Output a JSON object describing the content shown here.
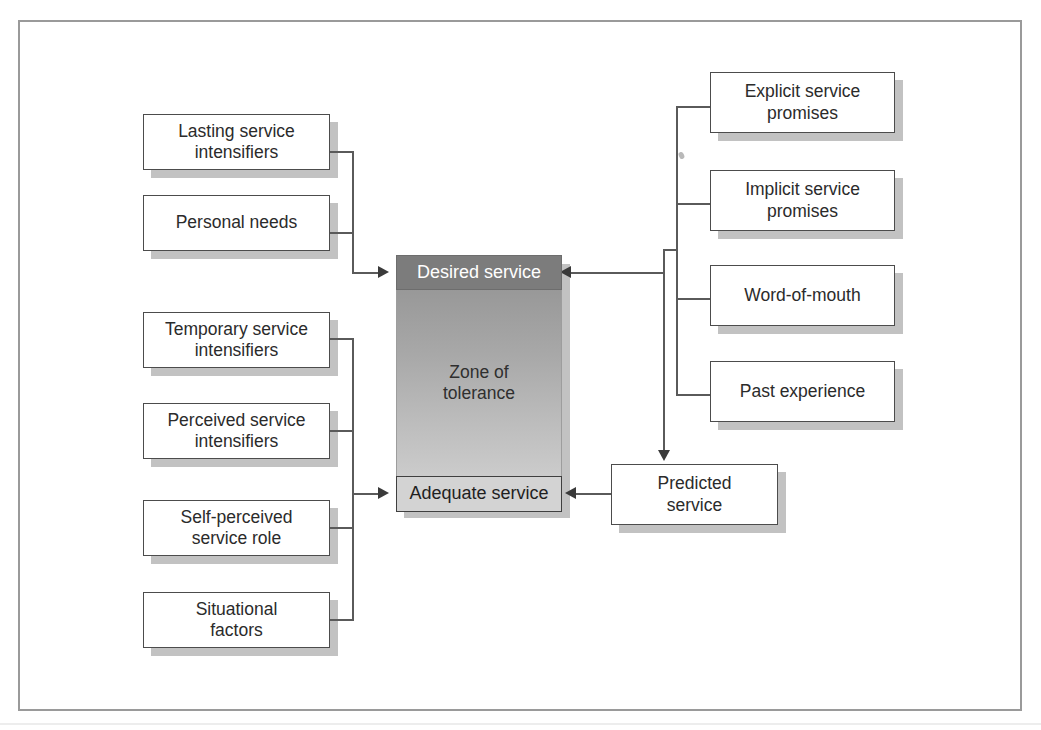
{
  "figure": {
    "frame_color": "#9a9a9a",
    "background": "#ffffff"
  },
  "center_stack": {
    "desired_service": {
      "label": "Desired service",
      "fill": "#7c7c7c",
      "text_color": "#ffffff"
    },
    "zone_of_tolerance": {
      "label": "Zone of\ntolerance",
      "gradient_top": "#989898",
      "gradient_bottom": "#cccccc",
      "text_color": "#2f2f2f"
    },
    "adequate_service": {
      "label": "Adequate service",
      "fill": "#d3d3d3",
      "text_color": "#1f1f1f"
    }
  },
  "left_upper_group": {
    "target": "Desired service",
    "items": [
      {
        "label": "Lasting service\nintensifiers"
      },
      {
        "label": "Personal needs"
      }
    ]
  },
  "left_lower_group": {
    "target": "Adequate service",
    "items": [
      {
        "label": "Temporary service\nintensifiers"
      },
      {
        "label": "Perceived service\nintensifiers"
      },
      {
        "label": "Self-perceived\nservice role"
      },
      {
        "label": "Situational\nfactors"
      }
    ]
  },
  "right_group": {
    "targets": [
      "Desired service",
      "Predicted service"
    ],
    "items": [
      {
        "label": "Explicit service\npromises"
      },
      {
        "label": "Implicit service\npromises"
      },
      {
        "label": "Word-of-mouth"
      },
      {
        "label": "Past experience"
      }
    ]
  },
  "predicted_service": {
    "label": "Predicted\nservice",
    "target": "Adequate service"
  },
  "colors": {
    "box_border": "#4c4c4c",
    "line": "#5a5a5a",
    "arrow": "#3a3a3a",
    "shadow": "#c2c2c2"
  }
}
